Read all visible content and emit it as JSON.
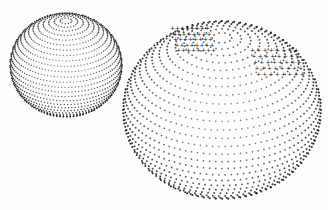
{
  "canvas": {
    "width": 328,
    "height": 210,
    "background": "#fdfdfd"
  },
  "dot_color": "#222222",
  "spheres": [
    {
      "name": "small-dotted-sphere",
      "cx": 66,
      "cy": 65,
      "rx": 56,
      "ry": 52,
      "tilt": 0.55,
      "rings": 30,
      "dot_spacing": 3.4,
      "dot_size": 0.85,
      "pole_x_offset": 4
    },
    {
      "name": "large-dotted-sphere",
      "cx": 222,
      "cy": 110,
      "rx": 99,
      "ry": 89,
      "tilt": 0.62,
      "rings": 32,
      "dot_spacing": 6.2,
      "dot_size": 1.0,
      "pole_x_offset": -8,
      "marks": [
        {
          "name": "dark-band-marks-left",
          "x": 170,
          "y": 30,
          "w": 40,
          "h": 28
        },
        {
          "name": "cross-marks-right",
          "x": 250,
          "y": 52,
          "w": 50,
          "h": 30
        }
      ]
    }
  ]
}
